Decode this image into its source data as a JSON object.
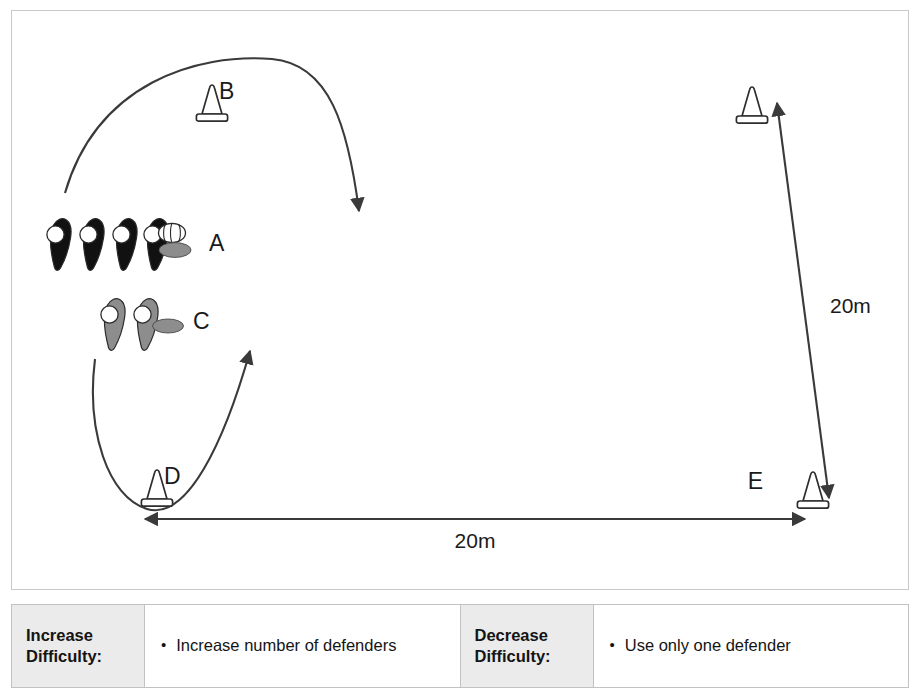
{
  "diagram": {
    "cones": [
      {
        "id": "cone-b",
        "label": "B"
      },
      {
        "id": "cone-d",
        "label": "D"
      },
      {
        "id": "cone-e",
        "label": "E"
      },
      {
        "id": "cone-top-right",
        "label": ""
      }
    ],
    "groups": [
      {
        "id": "group-a",
        "label": "A",
        "player_count": 4,
        "fill": "#111111",
        "has_ball": true
      },
      {
        "id": "group-c",
        "label": "C",
        "player_count": 2,
        "fill": "#8d8d8d",
        "has_ball": false
      }
    ],
    "measurements": [
      {
        "id": "horizontal-distance",
        "value": "20m"
      },
      {
        "id": "vertical-distance",
        "value": "20m"
      }
    ],
    "colors": {
      "frame_border": "#c9c9c9",
      "line": "#3a3a3a",
      "attacker_fill": "#111111",
      "defender_fill": "#8d8d8d",
      "shadow_fill": "#8d8d8d",
      "text": "#1a1a1a"
    }
  },
  "difficulty_table": {
    "rows": [
      {
        "increase_label": "Increase\nDifficulty:",
        "increase_label_line1": "Increase",
        "increase_label_line2": "Difficulty:",
        "increase_text": "Increase number of defenders",
        "increase_bullet": "•",
        "decrease_label_line1": "Decrease",
        "decrease_label_line2": "Difficulty:",
        "decrease_text": "Use only one defender",
        "decrease_bullet": "•"
      }
    ]
  }
}
